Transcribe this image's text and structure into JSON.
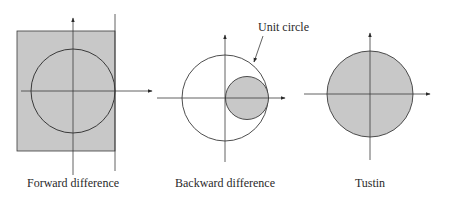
{
  "figure": {
    "panels": [
      {
        "id": "forward",
        "caption": "Forward difference",
        "description": "Shaded half-plane region left of the line Re=1 (shown as clipped rectangle) containing the unit circle"
      },
      {
        "id": "backward",
        "caption": "Backward difference",
        "description": "Unit circle with shaded small circle of radius 0.5 centered at 0.5",
        "annotation": "Unit circle"
      },
      {
        "id": "tustin",
        "caption": "Tustin",
        "description": "Shaded unit circle"
      }
    ],
    "colors": {
      "fill": "#c8c8c8",
      "stroke": "#3a3a3a",
      "background": "#ffffff"
    }
  }
}
